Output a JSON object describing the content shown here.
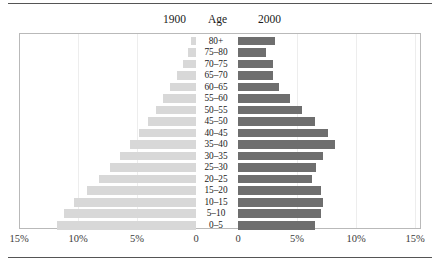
{
  "header": {
    "left_label": "1900",
    "center_label": "Age",
    "right_label": "2000"
  },
  "colors": {
    "series_1900": "#d8d8d8",
    "series_2000": "#6e6e6e",
    "frame": "#b9b9b9",
    "gridline": "#ededed",
    "rule": "#555555"
  },
  "axis": {
    "ticks": [
      "15%",
      "10%",
      "5%",
      "0",
      "0",
      "5%",
      "10%",
      "15%"
    ]
  },
  "chart_data": {
    "type": "bar",
    "title": "Age",
    "subtitle": "",
    "orientation": "horizontal",
    "layout": "population-pyramid",
    "xlabel": "",
    "ylabel": "Age",
    "xlim": [
      0,
      15
    ],
    "x_unit": "%",
    "grid": true,
    "legend_position": "top",
    "categories": [
      "80+",
      "75-80",
      "70-75",
      "65-70",
      "60-65",
      "55-60",
      "50-55",
      "45-50",
      "40-45",
      "35-40",
      "30-35",
      "25-30",
      "20-25",
      "15-20",
      "10-15",
      "5-10",
      "0-5"
    ],
    "series": [
      {
        "name": "1900",
        "direction": "left",
        "color": "#d8d8d8",
        "values": [
          0.4,
          0.7,
          1.1,
          1.6,
          2.2,
          2.8,
          3.4,
          4.1,
          4.8,
          5.6,
          6.4,
          7.3,
          8.2,
          9.2,
          10.3,
          11.2,
          11.8
        ]
      },
      {
        "name": "2000",
        "direction": "right",
        "color": "#6e6e6e",
        "values": [
          3.1,
          2.4,
          3.0,
          3.0,
          3.5,
          4.4,
          5.4,
          6.5,
          7.6,
          8.2,
          7.2,
          6.6,
          6.3,
          7.0,
          7.2,
          7.0,
          6.5
        ]
      }
    ]
  }
}
